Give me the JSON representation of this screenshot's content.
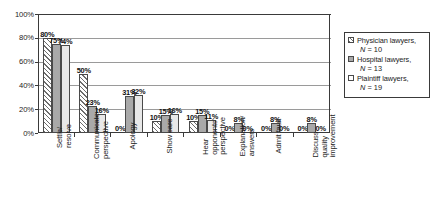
{
  "chart_data": {
    "type": "bar",
    "title": "",
    "subtitle": "",
    "xlabel": "",
    "ylabel": "",
    "ylim": [
      0,
      100
    ],
    "yticks": [
      "0%",
      "20%",
      "40%",
      "60%",
      "80%",
      "100%"
    ],
    "ytick_values": [
      0,
      20,
      40,
      60,
      80,
      100
    ],
    "grid": true,
    "legend_position": "right",
    "value_suffix": "%",
    "categories": [
      "Settle/ resolve",
      "Communicate perspective",
      "Apology",
      "Show care",
      "Hear opponents' perspective",
      "Explanation/ answers",
      "Admit fault",
      "Discuss quality improvement"
    ],
    "category_lines": [
      [
        "Settle/",
        "resolve"
      ],
      [
        "Communicate",
        "perspective"
      ],
      [
        "Apology"
      ],
      [
        "Show care"
      ],
      [
        "Hear",
        "opponents'",
        "perspective"
      ],
      [
        "Explanation/",
        "answers"
      ],
      [
        "Admit fault"
      ],
      [
        "Discuss",
        "quality",
        "improvement"
      ]
    ],
    "series": [
      {
        "name": "Physician lawyers",
        "n": 10,
        "n_label": "N = 10",
        "fill": "diagonal-hatch",
        "values": [
          80,
          50,
          0,
          10,
          10,
          0,
          0,
          0
        ],
        "labels": [
          "80%",
          "50%",
          "0%",
          "10%",
          "10%",
          "0%",
          "0%",
          "0%"
        ]
      },
      {
        "name": "Hospital lawyers",
        "n": 13,
        "n_label": "N = 13",
        "fill": "solid-gray",
        "values": [
          75,
          23,
          31,
          15,
          15,
          8,
          8,
          8
        ],
        "labels": [
          "75%",
          "23%",
          "31%",
          "15%",
          "15%",
          "8%",
          "8%",
          "8%"
        ]
      },
      {
        "name": "Plaintiff lawyers",
        "n": 19,
        "n_label": "N = 19",
        "fill": "white",
        "values": [
          74,
          16,
          32,
          16,
          11,
          0,
          0,
          0
        ],
        "labels": [
          "74%",
          "16%",
          "32%",
          "16%",
          "11%",
          "0%",
          "0%",
          "0%"
        ]
      }
    ]
  },
  "legend": {
    "entries": [
      {
        "label": "Physician lawyers,",
        "n_label": "N = 10",
        "swatch": "diagonal-hatch"
      },
      {
        "label": "Hospital lawyers,",
        "n_label": "N = 13",
        "swatch": "solid-gray"
      },
      {
        "label": "Plaintiff lawyers,",
        "n_label": "N = 19",
        "swatch": "white"
      }
    ]
  },
  "colors": {
    "series_1": "#ffffff",
    "series_2": "#a9a9a9",
    "series_3": "#e8e8e8",
    "axis": "#3a3a3a",
    "grid": "#9a9a9a",
    "text": "#1c1c1c",
    "background": "#ffffff"
  }
}
